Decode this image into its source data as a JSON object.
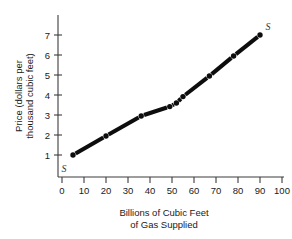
{
  "figure": {
    "background": "#ffffff",
    "ink_color": "#1a1a1a",
    "curve_color": "#0d0d0d"
  },
  "axes": {
    "x_title_line1": "Billions of Cubic Feet",
    "x_title_line2": "of Gas Supplied",
    "y_title_line1": "Price (dollars per",
    "y_title_line2": "thousand cubic feet)",
    "x_ticks": [
      "0",
      "10",
      "20",
      "30",
      "40",
      "50",
      "60",
      "70",
      "80",
      "90",
      "100"
    ],
    "y_ticks": [
      "1",
      "2",
      "3",
      "4",
      "5",
      "6",
      "7"
    ]
  },
  "annotations": {
    "supply_label_lower": "S",
    "supply_label_upper": "S"
  },
  "chart_data": {
    "type": "line",
    "title": "",
    "subtitle": "",
    "xlabel": "Billions of Cubic Feet of Gas Supplied",
    "ylabel": "Price (dollars per thousand cubic feet)",
    "xlim": [
      0,
      105
    ],
    "ylim": [
      0,
      7.6
    ],
    "xticks": [
      0,
      10,
      20,
      30,
      40,
      50,
      60,
      70,
      80,
      90,
      100
    ],
    "yticks": [
      1,
      2,
      3,
      4,
      5,
      6,
      7
    ],
    "grid": false,
    "legend": "none",
    "series": [
      {
        "name": "S",
        "label_start": "S",
        "label_end": "S",
        "marker": "filled-circle",
        "x": [
          5,
          20,
          36,
          49,
          52,
          55,
          67,
          78,
          90
        ],
        "y": [
          1.0,
          1.95,
          2.95,
          3.42,
          3.6,
          3.92,
          4.95,
          5.95,
          7.0
        ]
      }
    ],
    "annotations": [
      {
        "text": "S",
        "x": 3,
        "y": 0.6,
        "note": "lower end of supply curve"
      },
      {
        "text": "S",
        "x": 94,
        "y": 7.3,
        "note": "upper end of supply curve"
      }
    ]
  }
}
